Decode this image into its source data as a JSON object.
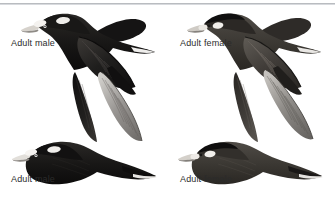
{
  "plate": {
    "width": 335,
    "height": 199,
    "background_color": "#ffffff",
    "divider_color": "#b9bcc0",
    "caption_color": "#2b2b2b",
    "subject": "Surf Scoter in flight",
    "panel_count": 4
  },
  "captions": {
    "top_left": "Adult male",
    "top_right": "Adult female",
    "bottom_left": "Adult male",
    "bottom_right": "Adult female"
  },
  "birds": {
    "top_left": {
      "label": "Adult male",
      "plumage": "blackish-brown body, white nape patch, white forehead patch, pale bill base",
      "body_color": "#1d1c1b",
      "wing_color": "#222120",
      "head_patch_color": "#f2f0ec",
      "position": "upper, wings raised-forward"
    },
    "top_right": {
      "label": "Adult female",
      "plumage": "dark brown body, two pale whitish face patches, dark crown",
      "body_color": "#3b3835",
      "wing_color": "#46423e",
      "head_patch_color": "#e9e6e1",
      "position": "upper, wings raised-forward"
    },
    "bottom_left": {
      "label": "Adult male",
      "plumage": "blackish body, white nape patch, white forehead patch, greyer underwing",
      "body_color": "#141313",
      "wing_color": "#8d8b88",
      "head_patch_color": "#f4f2ef",
      "position": "lower, wings raised showing pale underwing"
    },
    "bottom_right": {
      "label": "Adult female",
      "plumage": "brown body, pale face patches, greyish underwing",
      "body_color": "#4a4642",
      "wing_color": "#7d7a76",
      "head_patch_color": "#ece9e4",
      "position": "lower, wings raised showing pale underwing"
    }
  }
}
